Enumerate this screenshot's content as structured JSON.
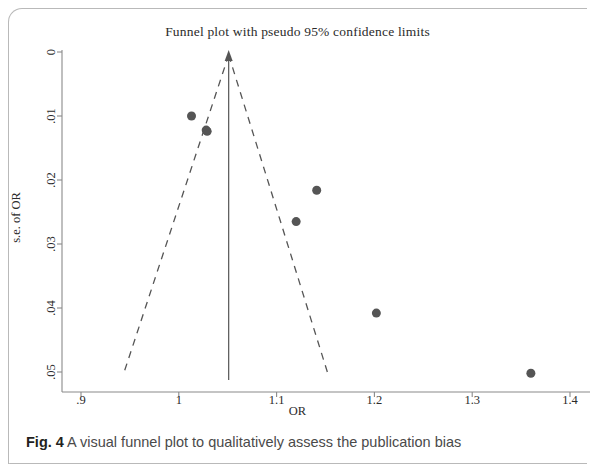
{
  "figure": {
    "caption_label": "Fig. 4",
    "caption_text": " A visual funnel plot to qualitatively assess the publication bias"
  },
  "chart_data": {
    "type": "scatter",
    "title": "Funnel plot with pseudo 95% confidence limits",
    "xlabel": "OR",
    "ylabel": "s.e. of OR",
    "xlim": [
      0.9,
      1.4
    ],
    "ylim": [
      0,
      0.0555
    ],
    "y_inverted": true,
    "grid": false,
    "legend": "none",
    "x_ticks": [
      0.9,
      1,
      1.1,
      1.2,
      1.3,
      1.4
    ],
    "x_tick_labels": [
      ".9",
      "1",
      "1.1",
      "1.2",
      "1.3",
      "1.4"
    ],
    "y_ticks": [
      0,
      0.01,
      0.02,
      0.03,
      0.04,
      0.05
    ],
    "y_tick_labels": [
      "0",
      ".01",
      ".02",
      ".03",
      ".04",
      ".05"
    ],
    "points": [
      {
        "x": 1.013,
        "y": 0.01
      },
      {
        "x": 1.028,
        "y": 0.0122
      },
      {
        "x": 1.141,
        "y": 0.0216
      },
      {
        "x": 1.12,
        "y": 0.0265
      },
      {
        "x": 1.202,
        "y": 0.0408
      },
      {
        "x": 1.36,
        "y": 0.0502
      },
      {
        "x": 1.029,
        "y": 0.0124
      }
    ],
    "point_color": "#555555",
    "point_size_px": 9,
    "pooled_effect": {
      "x": 1.051,
      "label": "pooled estimate reference line",
      "style": "solid-with-arrow",
      "color": "#555555"
    },
    "pseudo_ci_limits": {
      "label": "pseudo 95% confidence limits",
      "style": "dashed",
      "color": "#555555",
      "apex": {
        "x": 1.051,
        "y": 0
      },
      "left_end": {
        "x": 0.9435,
        "y": 0.0503
      },
      "right_end": {
        "x": 1.1525,
        "y": 0.0503
      }
    },
    "axis_color": "#8a8a8a"
  }
}
